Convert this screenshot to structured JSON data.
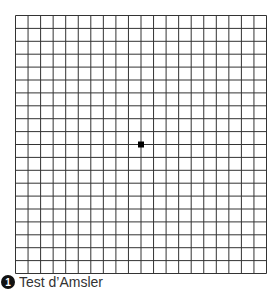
{
  "figure": {
    "grid": {
      "columns": 20,
      "rows": 20,
      "width": 251,
      "height": 258,
      "line_color": "#333333",
      "center_dot_color": "#000000"
    },
    "caption": {
      "number": "1",
      "text": "Test d’Amsler"
    }
  }
}
